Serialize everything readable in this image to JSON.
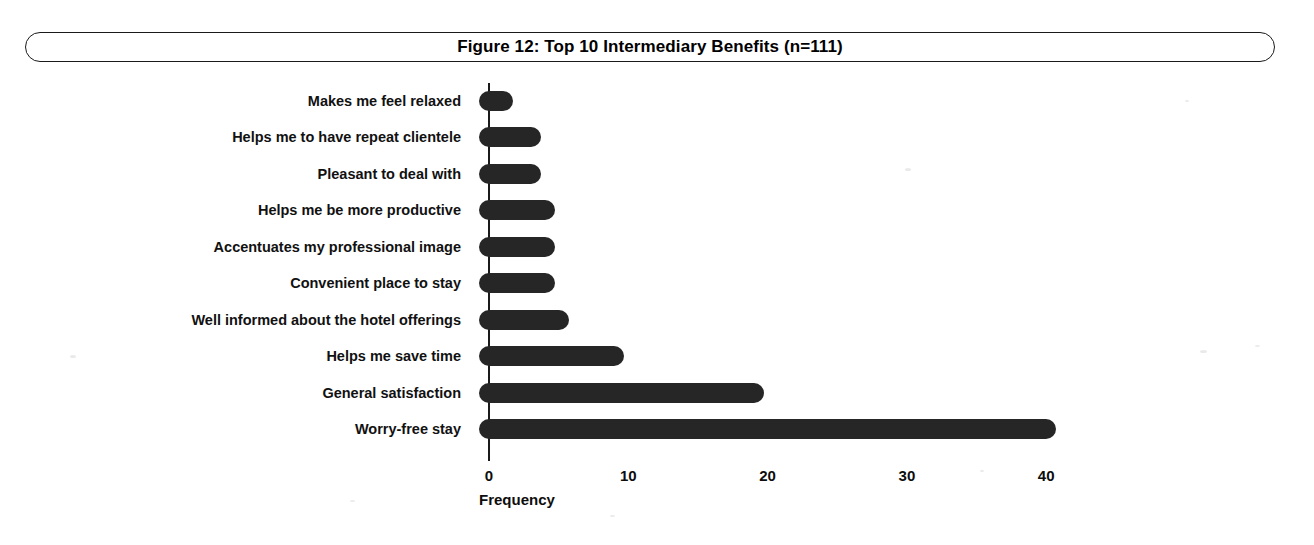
{
  "figure": {
    "title": "Figure 12: Top 10 Intermediary Benefits (n=111)"
  },
  "chart_data": {
    "type": "bar",
    "orientation": "horizontal",
    "title": "Figure 12: Top 10 Intermediary Benefits (n=111)",
    "xlabel": "Frequency",
    "ylabel": "",
    "categories": [
      "Makes me feel relaxed",
      "Helps me to have repeat clientele",
      "Pleasant to deal with",
      "Helps me be more productive",
      "Accentuates my professional image",
      "Convenient place to stay",
      "Well informed about the hotel offerings",
      "Helps me save time",
      "General satisfaction",
      "Worry-free stay"
    ],
    "values": [
      1,
      3,
      3,
      4,
      4,
      4,
      5,
      9,
      19,
      40
    ],
    "xlim": [
      0,
      40
    ],
    "xticks": [
      0,
      10,
      20,
      30,
      40
    ],
    "xtick_labels": [
      "0",
      "10",
      "20",
      "30",
      "40"
    ],
    "grid": false,
    "legend": false,
    "bar_color": "#262626",
    "axis_color": "#1a1a1a",
    "sample_size": "n=111"
  }
}
